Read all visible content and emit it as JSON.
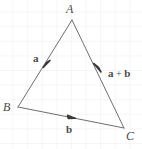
{
  "figure": {
    "type": "geometry-diagram",
    "background": "#ffffff",
    "grid_color": "#f2f2f2",
    "line_color": "#6e6e6e",
    "text_color": "#4a4a4a",
    "width": 142,
    "height": 149
  },
  "vertices": [
    {
      "id": "A",
      "label": "A",
      "x": 72,
      "y": 20
    },
    {
      "id": "B",
      "label": "B",
      "x": 18,
      "y": 107
    },
    {
      "id": "C",
      "label": "C",
      "x": 124,
      "y": 128
    }
  ],
  "edges": [
    {
      "id": "BA",
      "from": "B",
      "to": "A",
      "arrow": true,
      "arrow_at": 0.42
    },
    {
      "id": "AC",
      "from": "A",
      "to": "C",
      "arrow": true,
      "arrow_at": 0.48
    },
    {
      "id": "BC",
      "from": "B",
      "to": "C",
      "arrow": true,
      "arrow_at": 0.47
    }
  ],
  "vector_labels": {
    "a": "a",
    "b": "b",
    "a_plus_b_first": "a",
    "a_plus_b_operator": " + ",
    "a_plus_b_second": "b"
  }
}
